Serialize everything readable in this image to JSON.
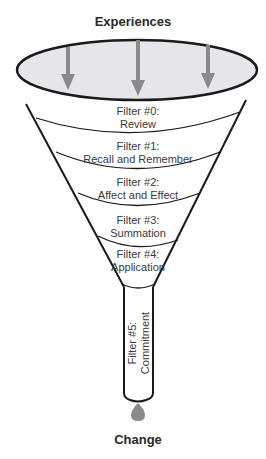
{
  "diagram": {
    "top_label": "Experiences",
    "bottom_label": "Change",
    "filters": [
      {
        "number": "Filter #0:",
        "name": "Review"
      },
      {
        "number": "Filter #1:",
        "name": "Recall and Remember"
      },
      {
        "number": "Filter #2:",
        "name": "Affect and Effect"
      },
      {
        "number": "Filter #3:",
        "name": "Summation"
      },
      {
        "number": "Filter #4:",
        "name": "Application"
      },
      {
        "number": "Filter #5:",
        "name": "Commitment"
      }
    ],
    "colors": {
      "outline": "#1a1a1a",
      "funnel_mouth": "#e6e6ea",
      "arrows": "#8a8a8a",
      "drop": "#8a8a8a"
    }
  }
}
